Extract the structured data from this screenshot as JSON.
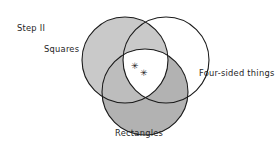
{
  "figure": {
    "step_label": "Step II",
    "type": "venn-diagram",
    "set_count": 3
  },
  "labels": {
    "squares": "Squares",
    "four_sided_things": "Four-sided things",
    "rectangles": "Rectangles"
  },
  "marks": {
    "asterisk_1": "✳",
    "asterisk_2": "✳",
    "count": 2,
    "region": "triple-intersection"
  },
  "circles": [
    {
      "name": "squares",
      "label": "Squares",
      "cx": 125,
      "cy": 60,
      "r": 43,
      "fill": "#c9c9c9",
      "stroke": "#1a1a1a",
      "filled": true
    },
    {
      "name": "four-sided-things",
      "label": "Four-sided things",
      "cx": 166,
      "cy": 60,
      "r": 43,
      "fill": "#ffffff",
      "stroke": "#1a1a1a",
      "filled": false
    },
    {
      "name": "rectangles",
      "label": "Rectangles",
      "cx": 145,
      "cy": 92,
      "r": 43,
      "fill": "#b2b2b2",
      "stroke": "#1a1a1a",
      "filled": true
    }
  ],
  "colors": {
    "background": "#ffffff",
    "stroke": "#1a1a1a",
    "squares_fill": "#c9c9c9",
    "rectangles_fill": "#b2b2b2",
    "four_sided_fill": "#ffffff",
    "center_fill": "#ffffff",
    "text": "#262626"
  }
}
